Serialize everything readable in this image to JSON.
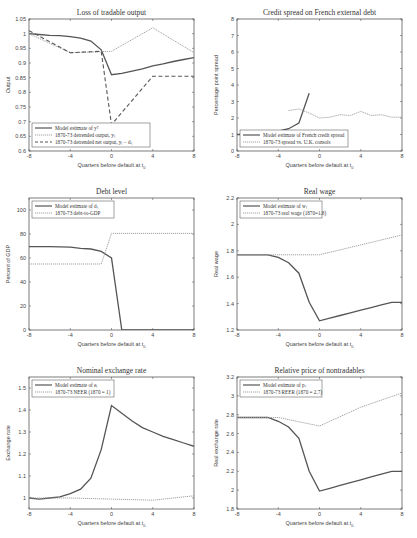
{
  "chart_data": [
    {
      "type": "line",
      "title": "Loss of tradable output",
      "xlabel": "Quarters before default at t_0",
      "ylabel": "Output",
      "xlim": [
        -8,
        8
      ],
      "ylim": [
        0.6,
        1.05
      ],
      "xticks": [
        -8,
        -4,
        0,
        4,
        8
      ],
      "yticks": [
        0.6,
        0.65,
        0.7,
        0.75,
        0.8,
        0.85,
        0.9,
        0.95,
        1,
        1.05
      ],
      "legend_position": "lower left",
      "series": [
        {
          "name": "Model estimate of y^T",
          "style": "solid",
          "x": [
            -8,
            -7,
            -6,
            -5,
            -4,
            -3,
            -2,
            -1,
            0,
            1,
            2,
            3,
            4,
            5,
            6,
            7,
            8
          ],
          "y": [
            1.0,
            0.997,
            0.994,
            0.993,
            0.99,
            0.985,
            0.975,
            0.945,
            0.86,
            0.865,
            0.872,
            0.88,
            0.89,
            0.897,
            0.905,
            0.912,
            0.918
          ]
        },
        {
          "name": "1870-73 detrended output, y_t",
          "style": "dotted",
          "x": [
            -8,
            -4,
            0,
            4,
            8
          ],
          "y": [
            1.0,
            0.935,
            0.94,
            1.02,
            0.935
          ]
        },
        {
          "name": "1870-73 detrended net output, y_t - d_t",
          "style": "dashed",
          "x": [
            -8,
            -4,
            -1,
            0,
            4,
            8
          ],
          "y": [
            1.01,
            0.935,
            0.94,
            0.69,
            0.855,
            0.855
          ]
        }
      ]
    },
    {
      "type": "line",
      "title": "Credit spread on French external debt",
      "xlabel": "Quarters before default at t_0",
      "ylabel": "Percentage point spread",
      "xlim": [
        -8,
        8
      ],
      "ylim": [
        0,
        8
      ],
      "xticks": [
        -8,
        -4,
        0,
        4,
        8
      ],
      "yticks": [
        0,
        1,
        2,
        3,
        4,
        5,
        6,
        7,
        8
      ],
      "legend_position": "lower left",
      "series": [
        {
          "name": "Model estimate of French credit spread",
          "style": "solid",
          "x": [
            -8,
            -7,
            -6,
            -5,
            -4,
            -3,
            -2,
            -1
          ],
          "y": [
            1.0,
            1.0,
            1.05,
            1.1,
            1.2,
            1.35,
            1.7,
            3.5
          ]
        },
        {
          "name": "1870-73 spread vs. U.K. consols",
          "style": "dotted",
          "x": [
            -3,
            -2,
            -1,
            0,
            1,
            2,
            3,
            4,
            5,
            6,
            7,
            8
          ],
          "y": [
            2.45,
            2.55,
            2.3,
            2.0,
            2.05,
            2.2,
            2.15,
            2.4,
            2.15,
            2.2,
            2.05,
            2.05
          ]
        }
      ]
    },
    {
      "type": "line",
      "title": "Debt level",
      "xlabel": "Quarters before default at t_0",
      "ylabel": "Percent of GDP",
      "xlim": [
        -8,
        8
      ],
      "ylim": [
        0,
        110
      ],
      "xticks": [
        -8,
        -4,
        0,
        4,
        8
      ],
      "yticks": [
        0,
        20,
        40,
        60,
        80,
        100
      ],
      "legend_position": "upper left",
      "series": [
        {
          "name": "Model estimate of d_t",
          "style": "solid",
          "x": [
            -8,
            -7,
            -6,
            -5,
            -4,
            -3,
            -2,
            -1,
            0,
            1,
            2,
            3,
            4,
            5,
            6,
            7,
            8
          ],
          "y": [
            69.5,
            69.5,
            69.5,
            69.3,
            69,
            68,
            67.5,
            65.5,
            60,
            0,
            0,
            0,
            0,
            0,
            0,
            0,
            0
          ]
        },
        {
          "name": "1870-73 debt-to-GDP",
          "style": "dotted",
          "x": [
            -8,
            -1,
            0,
            8
          ],
          "y": [
            55,
            55,
            80.5,
            80.5
          ]
        }
      ]
    },
    {
      "type": "line",
      "title": "Real wage",
      "xlabel": "Quarters before default at t_0",
      "ylabel": "Real wage",
      "xlim": [
        -8,
        8
      ],
      "ylim": [
        1.2,
        2.2
      ],
      "xticks": [
        -8,
        -4,
        0,
        4,
        8
      ],
      "yticks": [
        1.2,
        1.4,
        1.6,
        1.8,
        2,
        2.2
      ],
      "legend_position": "upper left",
      "series": [
        {
          "name": "Model estimate of w_t",
          "style": "solid",
          "x": [
            -8,
            -7,
            -6,
            -5,
            -4,
            -3,
            -2,
            -1,
            0,
            1,
            2,
            3,
            4,
            5,
            6,
            7,
            8
          ],
          "y": [
            1.77,
            1.77,
            1.77,
            1.77,
            1.75,
            1.71,
            1.63,
            1.41,
            1.27,
            1.29,
            1.31,
            1.33,
            1.35,
            1.37,
            1.39,
            1.41,
            1.41
          ]
        },
        {
          "name": "1870-73 real wage (1870=1.8)",
          "style": "dotted",
          "x": [
            -8,
            0,
            8
          ],
          "y": [
            1.77,
            1.77,
            1.92
          ]
        }
      ]
    },
    {
      "type": "line",
      "title": "Nominal exchange rate",
      "xlabel": "Quarters before default at t_0",
      "ylabel": "Exchange rate",
      "xlim": [
        -8,
        8
      ],
      "ylim": [
        0.95,
        1.55
      ],
      "xticks": [
        -8,
        -4,
        0,
        4,
        8
      ],
      "yticks": [
        1,
        1.1,
        1.2,
        1.3,
        1.4,
        1.5
      ],
      "legend_position": "upper left",
      "series": [
        {
          "name": "Model estimate of e_t",
          "style": "solid",
          "x": [
            -8,
            -7,
            -6,
            -5,
            -4,
            -3,
            -2,
            -1,
            0,
            1,
            2,
            3,
            4,
            5,
            6,
            7,
            8
          ],
          "y": [
            1.0,
            0.995,
            1.0,
            1.005,
            1.02,
            1.04,
            1.09,
            1.22,
            1.42,
            1.385,
            1.35,
            1.32,
            1.3,
            1.28,
            1.265,
            1.25,
            1.235
          ]
        },
        {
          "name": "1870-73 NEER (1870 = 1)",
          "style": "dotted",
          "x": [
            -8,
            -4,
            0,
            4,
            8
          ],
          "y": [
            1.0,
            1.0,
            0.995,
            0.99,
            1.01
          ]
        }
      ]
    },
    {
      "type": "line",
      "title": "Relative price of nontradables",
      "xlabel": "Quarters before default at t_0",
      "ylabel": "Real exchange rate",
      "xlim": [
        -8,
        8
      ],
      "ylim": [
        1.8,
        3.2
      ],
      "xticks": [
        -8,
        -4,
        0,
        4,
        8
      ],
      "yticks": [
        1.8,
        2,
        2.2,
        2.4,
        2.6,
        2.8,
        3,
        3.2
      ],
      "legend_position": "upper left",
      "series": [
        {
          "name": "Model estimate of p_t",
          "style": "solid",
          "x": [
            -8,
            -7,
            -6,
            -5,
            -4,
            -3,
            -2,
            -1,
            0,
            1,
            2,
            3,
            4,
            5,
            6,
            7,
            8
          ],
          "y": [
            2.77,
            2.77,
            2.77,
            2.77,
            2.73,
            2.67,
            2.55,
            2.2,
            1.99,
            2.02,
            2.05,
            2.08,
            2.11,
            2.14,
            2.17,
            2.2,
            2.2
          ]
        },
        {
          "name": "1870-73 REER (1870 = 2.7)",
          "style": "dotted",
          "x": [
            -8,
            -4,
            0,
            4,
            8
          ],
          "y": [
            2.77,
            2.77,
            2.68,
            2.88,
            3.03
          ]
        }
      ]
    }
  ],
  "panels": [
    {
      "title": "Loss of tradable output",
      "ylabel": "Output",
      "xlabel": "Quarters before default at t",
      "xlabel_sub": "0",
      "legend": [
        "Model estimate of yᵀ",
        "1870-73 detrended output, yₜ",
        "1870-73 detrended net output, yₜ − dₜ"
      ]
    },
    {
      "title": "Credit spread on French external debt",
      "ylabel": "Percentage point spread",
      "xlabel": "Quarters before default at t",
      "xlabel_sub": "0",
      "legend": [
        "Model estimate of French credit spread",
        "1870-73 spread vs. U.K. consols"
      ]
    },
    {
      "title": "Debt level",
      "ylabel": "Percent of GDP",
      "xlabel": "Quarters before default at t",
      "xlabel_sub": "0",
      "legend": [
        "Model estimate of dₜ",
        "1870-73 debt-to-GDP"
      ]
    },
    {
      "title": "Real wage",
      "ylabel": "Real wage",
      "xlabel": "Quarters before default at t",
      "xlabel_sub": "0",
      "legend": [
        "Model estimate of wₜ",
        "1870-73 real wage (1870=1.8)"
      ]
    },
    {
      "title": "Nominal exchange rate",
      "ylabel": "Exchange rate",
      "xlabel": "Quarters before default at t",
      "xlabel_sub": "0",
      "legend": [
        "Model estimate of eₜ",
        "1870-73 NEER (1870 = 1)"
      ]
    },
    {
      "title": "Relative price of nontradables",
      "ylabel": "Real exchange rate",
      "xlabel": "Quarters before default at t",
      "xlabel_sub": "0",
      "legend": [
        "Model estimate of pₜ",
        "1870-73 REER (1870 = 2.7)"
      ]
    }
  ],
  "colors": {
    "model": "#555555",
    "data": "#999999",
    "axis": "#444444"
  }
}
